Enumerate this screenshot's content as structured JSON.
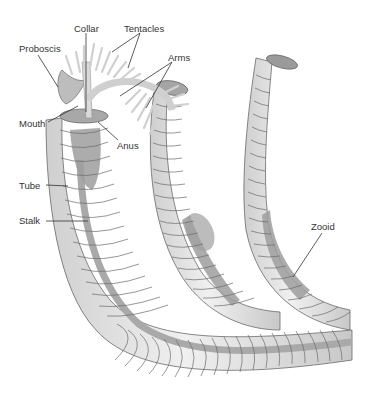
{
  "figure": {
    "labels": [
      {
        "id": "collar",
        "text": "Collar",
        "x": 74,
        "y": 24
      },
      {
        "id": "tentacles",
        "text": "Tentacles",
        "x": 124,
        "y": 24
      },
      {
        "id": "proboscis",
        "text": "Proboscis",
        "x": 19,
        "y": 44
      },
      {
        "id": "arms",
        "text": "Arms",
        "x": 168,
        "y": 53
      },
      {
        "id": "mouth",
        "text": "Mouth",
        "x": 19,
        "y": 119
      },
      {
        "id": "anus",
        "text": "Anus",
        "x": 117,
        "y": 141
      },
      {
        "id": "tube",
        "text": "Tube",
        "x": 19,
        "y": 181
      },
      {
        "id": "stalk",
        "text": "Stalk",
        "x": 19,
        "y": 216
      },
      {
        "id": "zooid",
        "text": "Zooid",
        "x": 311,
        "y": 222
      }
    ],
    "colors": {
      "tube_fill": "#e4e4e4",
      "tube_ring": "#6a6a6a",
      "stalk": "#a9a9a9",
      "zooid_body": "#9d9d9d",
      "tentacle": "#d6d6d6",
      "leader_line": "#333333"
    }
  }
}
